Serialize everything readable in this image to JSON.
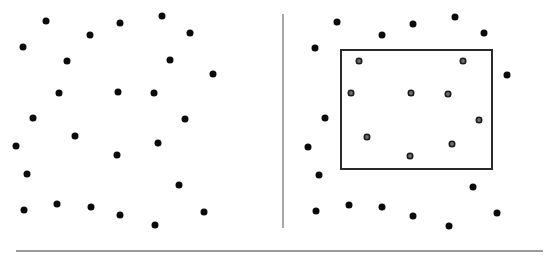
{
  "diagram": {
    "colors": {
      "dot": "#0a0a0a",
      "selected_dot_fill": "#6e6e6e",
      "selected_dot_ring": "#1a1a1a",
      "divider": "#a8a8a8",
      "baseline": "#9a9a9a",
      "selection_box": "#2a2a2a",
      "background": "#ffffff"
    },
    "divider": {
      "x": 283,
      "y1": 14,
      "y2": 228
    },
    "baseline": {
      "y": 251,
      "x1": 16,
      "x2": 543
    },
    "left_panel": {
      "points": [
        [
          46,
          21
        ],
        [
          90,
          35
        ],
        [
          120,
          23
        ],
        [
          23,
          47
        ],
        [
          67,
          61
        ],
        [
          162,
          16
        ],
        [
          190,
          33
        ],
        [
          170,
          60
        ],
        [
          213,
          74
        ],
        [
          59,
          93
        ],
        [
          118,
          92
        ],
        [
          154,
          93
        ],
        [
          33,
          118
        ],
        [
          185,
          119
        ],
        [
          75,
          136
        ],
        [
          158,
          143
        ],
        [
          16,
          146
        ],
        [
          117,
          155
        ],
        [
          27,
          174
        ],
        [
          179,
          185
        ],
        [
          24,
          210
        ],
        [
          57,
          204
        ],
        [
          91,
          207
        ],
        [
          120,
          215
        ],
        [
          155,
          225
        ],
        [
          204,
          212
        ]
      ]
    },
    "right_panel": {
      "selection_box": {
        "x1": 340,
        "y1": 49,
        "x2": 493,
        "y2": 170
      },
      "points": [
        [
          337,
          22
        ],
        [
          382,
          35
        ],
        [
          413,
          24
        ],
        [
          455,
          17
        ],
        [
          484,
          33
        ],
        [
          315,
          48
        ],
        [
          507,
          75
        ],
        [
          325,
          118
        ],
        [
          308,
          147
        ],
        [
          319,
          175
        ],
        [
          473,
          187
        ],
        [
          316,
          211
        ],
        [
          349,
          205
        ],
        [
          382,
          207
        ],
        [
          413,
          216
        ],
        [
          449,
          226
        ],
        [
          497,
          213
        ]
      ],
      "selected_points": [
        [
          359,
          61
        ],
        [
          463,
          61
        ],
        [
          351,
          93
        ],
        [
          411,
          93
        ],
        [
          448,
          94
        ],
        [
          479,
          120
        ],
        [
          367,
          137
        ],
        [
          410,
          156
        ],
        [
          452,
          144
        ]
      ]
    }
  }
}
